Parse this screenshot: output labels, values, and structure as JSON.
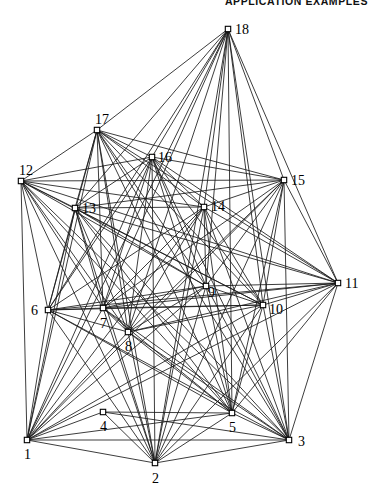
{
  "figure": {
    "header": "APPLICATION EXAMPLES",
    "caption": "",
    "background_color": "#ffffff",
    "line_color": "#1a1a1a",
    "node_fill": "#ffffff",
    "node_stroke": "#000000",
    "width": 374,
    "height": 501
  },
  "chart_data": {
    "type": "scatter",
    "title": "",
    "subtitle": "",
    "xlabel": "",
    "ylabel": "",
    "grid": false,
    "legend": "none",
    "xlim": [
      0,
      374
    ],
    "ylim": [
      0,
      501
    ],
    "node_count": 18,
    "edge_count": 111,
    "nodes": [
      {
        "id": 1,
        "label": "1",
        "x": 27,
        "y": 440,
        "label_dx": -3,
        "label_dy": 19
      },
      {
        "id": 2,
        "label": "2",
        "x": 155,
        "y": 463,
        "label_dx": -3,
        "label_dy": 20
      },
      {
        "id": 3,
        "label": "3",
        "x": 289,
        "y": 440,
        "label_dx": 9,
        "label_dy": 6
      },
      {
        "id": 4,
        "label": "4",
        "x": 103,
        "y": 412,
        "label_dx": -3,
        "label_dy": 19
      },
      {
        "id": 5,
        "label": "5",
        "x": 232,
        "y": 413,
        "label_dx": -3,
        "label_dy": 19
      },
      {
        "id": 6,
        "label": "6",
        "x": 48,
        "y": 310,
        "label_dx": -17,
        "label_dy": 5
      },
      {
        "id": 7,
        "label": "7",
        "x": 103,
        "y": 308,
        "label_dx": -3,
        "label_dy": 20
      },
      {
        "id": 8,
        "label": "8",
        "x": 128,
        "y": 332,
        "label_dx": -3,
        "label_dy": 19
      },
      {
        "id": 9,
        "label": "9",
        "x": 206,
        "y": 286,
        "label_dx": 2,
        "label_dy": 11
      },
      {
        "id": 10,
        "label": "10",
        "x": 263,
        "y": 305,
        "label_dx": 6,
        "label_dy": 9
      },
      {
        "id": 11,
        "label": "11",
        "x": 338,
        "y": 283,
        "label_dx": 7,
        "label_dy": 5
      },
      {
        "id": 12,
        "label": "12",
        "x": 21,
        "y": 181,
        "label_dx": -2,
        "label_dy": -6
      },
      {
        "id": 13,
        "label": "13",
        "x": 75,
        "y": 208,
        "label_dx": 7,
        "label_dy": 5
      },
      {
        "id": 14,
        "label": "14",
        "x": 204,
        "y": 207,
        "label_dx": 7,
        "label_dy": 4
      },
      {
        "id": 15,
        "label": "15",
        "x": 284,
        "y": 180,
        "label_dx": 7,
        "label_dy": 5
      },
      {
        "id": 16,
        "label": "16",
        "x": 152,
        "y": 157,
        "label_dx": 6,
        "label_dy": 5
      },
      {
        "id": 17,
        "label": "17",
        "x": 97,
        "y": 130,
        "label_dx": -2,
        "label_dy": -6
      },
      {
        "id": 18,
        "label": "18",
        "x": 228,
        "y": 29,
        "label_dx": 7,
        "label_dy": 5
      }
    ],
    "edges": [
      [
        18,
        1
      ],
      [
        18,
        2
      ],
      [
        18,
        3
      ],
      [
        18,
        5
      ],
      [
        18,
        7
      ],
      [
        18,
        8
      ],
      [
        18,
        9
      ],
      [
        18,
        10
      ],
      [
        18,
        13
      ],
      [
        18,
        14
      ],
      [
        18,
        16
      ],
      [
        18,
        17
      ],
      [
        18,
        15
      ],
      [
        18,
        11
      ],
      [
        18,
        6
      ],
      [
        17,
        1
      ],
      [
        17,
        2
      ],
      [
        17,
        3
      ],
      [
        17,
        5
      ],
      [
        17,
        6
      ],
      [
        17,
        7
      ],
      [
        17,
        8
      ],
      [
        17,
        9
      ],
      [
        17,
        10
      ],
      [
        17,
        11
      ],
      [
        17,
        13
      ],
      [
        17,
        14
      ],
      [
        17,
        15
      ],
      [
        17,
        16
      ],
      [
        17,
        12
      ],
      [
        16,
        1
      ],
      [
        16,
        2
      ],
      [
        16,
        3
      ],
      [
        16,
        5
      ],
      [
        16,
        6
      ],
      [
        16,
        7
      ],
      [
        16,
        8
      ],
      [
        16,
        9
      ],
      [
        16,
        10
      ],
      [
        16,
        11
      ],
      [
        16,
        13
      ],
      [
        16,
        14
      ],
      [
        16,
        15
      ],
      [
        16,
        12
      ],
      [
        15,
        1
      ],
      [
        15,
        2
      ],
      [
        15,
        5
      ],
      [
        15,
        7
      ],
      [
        15,
        8
      ],
      [
        15,
        9
      ],
      [
        15,
        10
      ],
      [
        15,
        11
      ],
      [
        15,
        13
      ],
      [
        15,
        14
      ],
      [
        15,
        3
      ],
      [
        15,
        12
      ],
      [
        14,
        1
      ],
      [
        14,
        2
      ],
      [
        14,
        3
      ],
      [
        14,
        5
      ],
      [
        14,
        6
      ],
      [
        14,
        7
      ],
      [
        14,
        8
      ],
      [
        14,
        9
      ],
      [
        14,
        10
      ],
      [
        14,
        11
      ],
      [
        14,
        13
      ],
      [
        14,
        12
      ],
      [
        13,
        1
      ],
      [
        13,
        2
      ],
      [
        13,
        3
      ],
      [
        13,
        5
      ],
      [
        13,
        6
      ],
      [
        13,
        7
      ],
      [
        13,
        8
      ],
      [
        13,
        9
      ],
      [
        13,
        10
      ],
      [
        13,
        11
      ],
      [
        13,
        12
      ],
      [
        12,
        1
      ],
      [
        12,
        2
      ],
      [
        12,
        3
      ],
      [
        12,
        5
      ],
      [
        12,
        6
      ],
      [
        12,
        7
      ],
      [
        12,
        8
      ],
      [
        12,
        9
      ],
      [
        12,
        10
      ],
      [
        12,
        11
      ],
      [
        11,
        1
      ],
      [
        11,
        2
      ],
      [
        11,
        3
      ],
      [
        11,
        5
      ],
      [
        11,
        6
      ],
      [
        11,
        7
      ],
      [
        11,
        8
      ],
      [
        11,
        9
      ],
      [
        11,
        10
      ],
      [
        10,
        1
      ],
      [
        10,
        2
      ],
      [
        10,
        3
      ],
      [
        10,
        5
      ],
      [
        10,
        6
      ],
      [
        10,
        7
      ],
      [
        10,
        8
      ],
      [
        10,
        9
      ],
      [
        9,
        1
      ],
      [
        9,
        2
      ],
      [
        9,
        3
      ],
      [
        9,
        5
      ],
      [
        9,
        6
      ],
      [
        9,
        7
      ],
      [
        9,
        8
      ],
      [
        8,
        1
      ],
      [
        8,
        2
      ],
      [
        8,
        3
      ],
      [
        8,
        5
      ],
      [
        8,
        6
      ],
      [
        8,
        7
      ],
      [
        7,
        1
      ],
      [
        7,
        2
      ],
      [
        7,
        3
      ],
      [
        7,
        5
      ],
      [
        7,
        6
      ],
      [
        6,
        1
      ],
      [
        6,
        2
      ],
      [
        6,
        3
      ],
      [
        6,
        5
      ],
      [
        5,
        1
      ],
      [
        5,
        2
      ],
      [
        5,
        3
      ],
      [
        5,
        4
      ],
      [
        4,
        1
      ],
      [
        4,
        2
      ],
      [
        4,
        3
      ],
      [
        3,
        1
      ],
      [
        3,
        2
      ],
      [
        2,
        1
      ]
    ]
  }
}
